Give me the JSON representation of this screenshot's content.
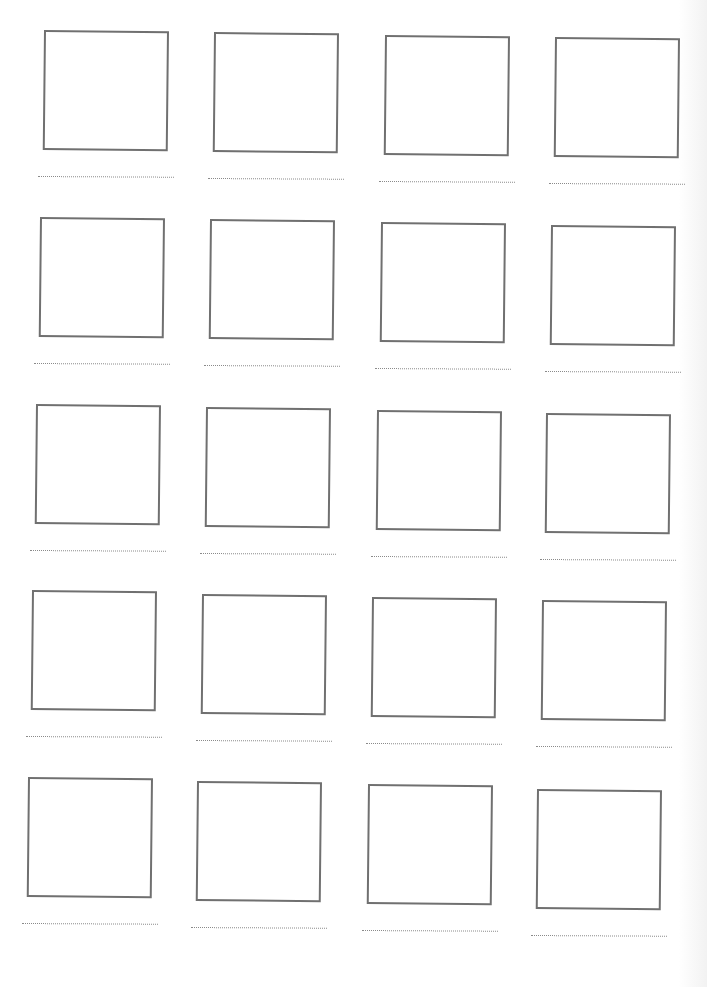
{
  "worksheet": {
    "rows": 5,
    "columns": 4,
    "cells": [
      {
        "row": 1,
        "col": 1,
        "x": 38,
        "y": 30
      },
      {
        "row": 1,
        "col": 2,
        "x": 208,
        "y": 32
      },
      {
        "row": 1,
        "col": 3,
        "x": 379,
        "y": 35
      },
      {
        "row": 1,
        "col": 4,
        "x": 549,
        "y": 37
      },
      {
        "row": 2,
        "col": 1,
        "x": 34,
        "y": 217
      },
      {
        "row": 2,
        "col": 2,
        "x": 204,
        "y": 219
      },
      {
        "row": 2,
        "col": 3,
        "x": 375,
        "y": 222
      },
      {
        "row": 2,
        "col": 4,
        "x": 545,
        "y": 225
      },
      {
        "row": 3,
        "col": 1,
        "x": 30,
        "y": 404
      },
      {
        "row": 3,
        "col": 2,
        "x": 200,
        "y": 407
      },
      {
        "row": 3,
        "col": 3,
        "x": 371,
        "y": 410
      },
      {
        "row": 3,
        "col": 4,
        "x": 540,
        "y": 413
      },
      {
        "row": 4,
        "col": 1,
        "x": 26,
        "y": 590
      },
      {
        "row": 4,
        "col": 2,
        "x": 196,
        "y": 594
      },
      {
        "row": 4,
        "col": 3,
        "x": 366,
        "y": 597
      },
      {
        "row": 4,
        "col": 4,
        "x": 536,
        "y": 600
      },
      {
        "row": 5,
        "col": 1,
        "x": 22,
        "y": 777
      },
      {
        "row": 5,
        "col": 2,
        "x": 191,
        "y": 781
      },
      {
        "row": 5,
        "col": 3,
        "x": 362,
        "y": 784
      },
      {
        "row": 5,
        "col": 4,
        "x": 531,
        "y": 789
      }
    ],
    "box_border_color": "#707070",
    "line_color": "#8a8a8a"
  }
}
